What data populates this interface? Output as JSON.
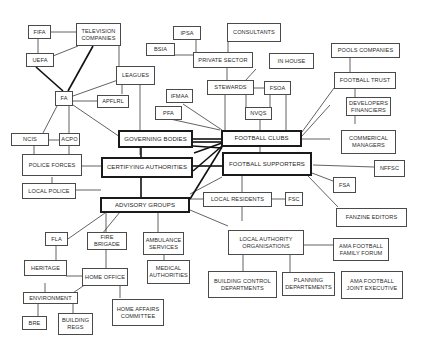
{
  "diagram": {
    "type": "stakeholder network",
    "colors": {
      "line": "#3a3a3a",
      "thick_line": "#111111",
      "box_border": "#4a4a4a",
      "background": "#ffffff"
    },
    "nodes": {
      "fifa": "FIFA",
      "tv": "TELEVISION\nCOMPANIES",
      "uefa": "UEFA",
      "leagues": "LEAGUES",
      "fa": "FA",
      "apflrl": "APFLRL",
      "ipsa": "IPSA",
      "consultants": "CONSULTANTS",
      "bsia": "BSIA",
      "private_sector": "PRIVATE SECTOR",
      "in_house": "IN HOUSE",
      "stewards": "STEWARDS",
      "fsoa": "FSOA",
      "nvqs": "NVQs",
      "ifmaa": "IFMAA",
      "pfa": "PFA",
      "pools_companies": "POOLS COMPANIES",
      "football_trust": "FOOTBALL TRUST",
      "developers": "DEVELOPERS\nFINANCIERS",
      "commercial": "COMMERICAL\nMANAGERS",
      "ncis": "NCIS",
      "acpo": "ACPO",
      "governing_bodies": "GOVERNING BODIES",
      "football_clubs": "FOOTBALL CLUBS",
      "police_forces": "POLICE FORCES",
      "certifying": "CERTIFYING AUTHORITIES",
      "football_supporters": "FOOTBALL SUPPORTERS",
      "nffsc": "NFFSC",
      "local_police": "LOCAL POLICE",
      "fsa": "FSA",
      "advisory_groups": "ADVISORY GROUPS",
      "local_residents": "LOCAL RESIDENTS",
      "fsc": "FSC",
      "fanzine": "FANZINE EDITORS",
      "fla": "FLA",
      "fire_brigade": "FIRE\nBRIGADE",
      "ambulance": "AMBULANCE\nSERVICES",
      "local_authority": "LOCAL AUTHORITY\nORGANISATIONS",
      "ama_forum": "AMA FOOTBALL\nFAMILY FORUM",
      "heritage": "HERITAGE",
      "home_office": "HOME OFFICE",
      "medical": "MEDICAL\nAUTHORITIES",
      "environment": "ENVIRONMENT",
      "home_affairs": "HOME AFFAIRS\nCOMMITTEE",
      "building_control": "BUILDING CONTROL\nDEPARTMENTS",
      "planning": "PLANNING\nDEPARTEMENTS",
      "ama_joint": "AMA FOOTBALL\nJOINT EXECUTIVE",
      "bre": "BRE",
      "building_regs": "BUILDING\nREGS"
    }
  }
}
